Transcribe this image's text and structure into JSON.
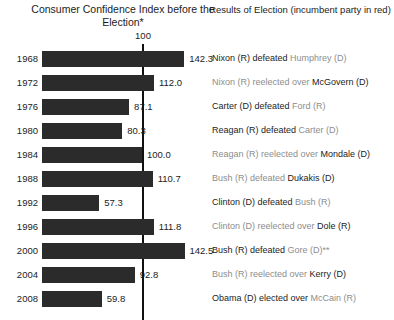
{
  "headers": {
    "left": "Consumer Confidence Index before the Election*",
    "right": "Results of Election (incumbent party in red)"
  },
  "reference": {
    "label": "100",
    "value": 100
  },
  "chart_data": {
    "type": "bar",
    "orientation": "horizontal",
    "title": "Consumer Confidence Index before the Election*",
    "xlabel": "",
    "ylabel": "",
    "categories": [
      "1968",
      "1972",
      "1976",
      "1980",
      "1984",
      "1988",
      "1992",
      "1996",
      "2000",
      "2004",
      "2008"
    ],
    "values": [
      142.3,
      112.0,
      87.1,
      80.3,
      100.0,
      110.7,
      57.3,
      111.8,
      142.5,
      92.8,
      59.8
    ],
    "value_labels": [
      "142.3",
      "112.0",
      "87.1",
      "80.3",
      "100.0",
      "110.7",
      "57.3",
      "111.8",
      "142.5",
      "92.8",
      "59.8"
    ],
    "reference_line": 100,
    "reference_line_label": "100",
    "xlim": [
      0,
      150
    ],
    "grid": false,
    "legend": false,
    "bar_color": "#2b2b2b",
    "annotations": [
      "Results of Election (incumbent party in red)"
    ]
  },
  "results": [
    {
      "year": "1968",
      "segments": [
        {
          "text": "Nixon (R) defeated ",
          "role": "challenger"
        },
        {
          "text": "Humphrey (D)",
          "role": "incumbent"
        }
      ]
    },
    {
      "year": "1972",
      "segments": [
        {
          "text": "Nixon (R) reelected over ",
          "role": "incumbent"
        },
        {
          "text": "McGovern (D)",
          "role": "challenger"
        }
      ]
    },
    {
      "year": "1976",
      "segments": [
        {
          "text": "Carter (D) defeated ",
          "role": "challenger"
        },
        {
          "text": "Ford (R)",
          "role": "incumbent"
        }
      ]
    },
    {
      "year": "1980",
      "segments": [
        {
          "text": "Reagan (R) defeated ",
          "role": "challenger"
        },
        {
          "text": "Carter (D)",
          "role": "incumbent"
        }
      ]
    },
    {
      "year": "1984",
      "segments": [
        {
          "text": "Reagan (R) reelected over ",
          "role": "incumbent"
        },
        {
          "text": "Mondale (D)",
          "role": "challenger"
        }
      ]
    },
    {
      "year": "1988",
      "segments": [
        {
          "text": "Bush (R) defeated ",
          "role": "incumbent"
        },
        {
          "text": "Dukakis (D)",
          "role": "challenger"
        }
      ]
    },
    {
      "year": "1992",
      "segments": [
        {
          "text": "Clinton (D) defeated ",
          "role": "challenger"
        },
        {
          "text": "Bush (R)",
          "role": "incumbent"
        }
      ]
    },
    {
      "year": "1996",
      "segments": [
        {
          "text": "Clinton (D) reelected over ",
          "role": "incumbent"
        },
        {
          "text": "Dole (R)",
          "role": "challenger"
        }
      ]
    },
    {
      "year": "2000",
      "segments": [
        {
          "text": "Bush (R) defeated ",
          "role": "challenger"
        },
        {
          "text": "Gore (D)**",
          "role": "incumbent"
        }
      ]
    },
    {
      "year": "2004",
      "segments": [
        {
          "text": "Bush (R) reelected over ",
          "role": "incumbent"
        },
        {
          "text": "Kerry (D)",
          "role": "challenger"
        }
      ]
    },
    {
      "year": "2008",
      "segments": [
        {
          "text": "Obama (D) elected over ",
          "role": "challenger"
        },
        {
          "text": "McCain (R)",
          "role": "incumbent"
        }
      ]
    }
  ],
  "colors": {
    "bar": "#2b2b2b",
    "text": "#1c1c1c",
    "incumbent_text": "#8d8d8d",
    "reference_line": "#111111",
    "background": "#ffffff"
  }
}
